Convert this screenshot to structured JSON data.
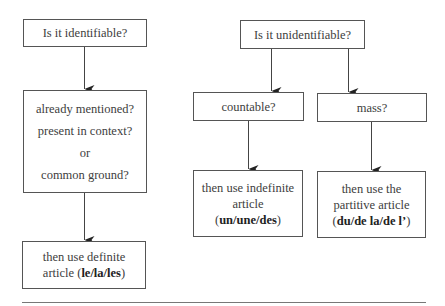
{
  "diagram": {
    "left_branch": {
      "question": "Is it identifiable?",
      "conditions": [
        "already mentioned?",
        "present in context?",
        "or",
        "common ground?"
      ],
      "result": {
        "line1": "then use definite",
        "line2_prefix": "article (",
        "articles": "le/la/les",
        "line2_suffix": ")"
      }
    },
    "right_branch": {
      "question": "Is it unidentifiable?",
      "countable": {
        "question": "countable?",
        "result": {
          "line1": "then use indefinite",
          "line2": "article",
          "open": "(",
          "articles": "un/une/des",
          "close": ")"
        }
      },
      "mass": {
        "question": "mass?",
        "result": {
          "line1": "then use the",
          "line2": "partitive article",
          "open": "(",
          "articles": "du/de la/de l’",
          "close": ")"
        }
      }
    },
    "colors": {
      "border": "#555555",
      "text": "#3d3d3d",
      "rule": "#777777"
    }
  }
}
